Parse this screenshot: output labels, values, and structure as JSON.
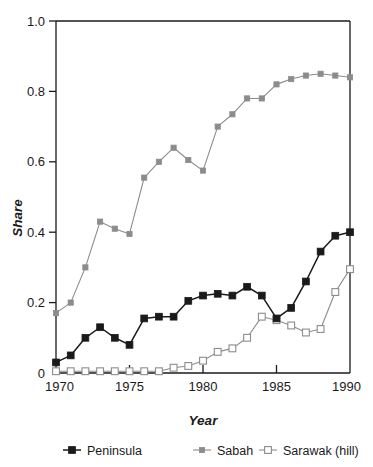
{
  "chart_data": {
    "type": "line",
    "title": "",
    "xlabel": "Year",
    "ylabel": "Share",
    "xlim": [
      1970,
      1990
    ],
    "ylim": [
      0,
      1.0
    ],
    "xticks": [
      1970,
      1975,
      1980,
      1985,
      1990
    ],
    "xtick_labels": [
      "1970",
      "1975",
      "1980",
      "1985",
      "1990"
    ],
    "yticks": [
      0,
      0.2,
      0.4,
      0.6,
      0.8,
      1.0
    ],
    "ytick_labels": [
      "0",
      "0.2",
      "0.4",
      "0.6",
      "0.8",
      "1.0"
    ],
    "grid": false,
    "legend_position": "below",
    "x": [
      1970,
      1971,
      1972,
      1973,
      1974,
      1975,
      1976,
      1977,
      1978,
      1979,
      1980,
      1981,
      1982,
      1983,
      1984,
      1985,
      1986,
      1987,
      1988,
      1989,
      1990
    ],
    "series": [
      {
        "name": "Peninsula",
        "color": "#1a1a1a",
        "marker": "filled-square",
        "values": [
          0.03,
          0.05,
          0.1,
          0.13,
          0.1,
          0.08,
          0.155,
          0.16,
          0.16,
          0.205,
          0.22,
          0.225,
          0.22,
          0.245,
          0.22,
          0.155,
          0.185,
          0.26,
          0.345,
          0.39,
          0.4
        ]
      },
      {
        "name": "Sabah",
        "color": "#8c8c8c",
        "marker": "filled-square-gray",
        "values": [
          0.17,
          0.2,
          0.3,
          0.43,
          0.41,
          0.395,
          0.555,
          0.6,
          0.64,
          0.605,
          0.575,
          0.7,
          0.735,
          0.78,
          0.78,
          0.82,
          0.835,
          0.845,
          0.85,
          0.845,
          0.84
        ]
      },
      {
        "name": "Sarawak (hill)",
        "color": "#8c8c8c",
        "marker": "open-square",
        "values": [
          0.005,
          0.005,
          0.005,
          0.005,
          0.005,
          0.005,
          0.005,
          0.005,
          0.015,
          0.02,
          0.035,
          0.06,
          0.07,
          0.1,
          0.16,
          0.15,
          0.135,
          0.115,
          0.125,
          0.23,
          0.295
        ]
      }
    ]
  },
  "legend": {
    "items": [
      {
        "label": "Peninsula"
      },
      {
        "label": "Sabah"
      },
      {
        "label": "Sarawak (hill)"
      }
    ]
  },
  "axes": {
    "y_title": "Share",
    "x_title": "Year"
  }
}
